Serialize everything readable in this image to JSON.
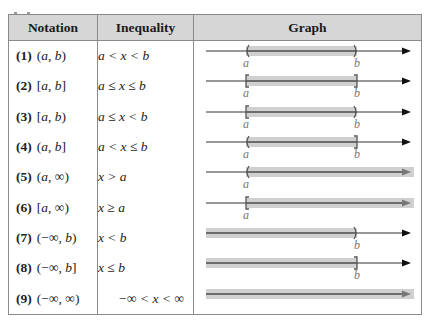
{
  "table": {
    "headers": [
      "Notation",
      "Inequality",
      "Graph"
    ],
    "rows": [
      {
        "number": "(1)",
        "notation": "(a, b)",
        "inequality": "a < x < b",
        "graph": {
          "left": "open",
          "right": "open",
          "left_label": "a",
          "right_label": "b",
          "left_end": "a",
          "right_end": "b"
        }
      },
      {
        "number": "(2)",
        "notation": "[a, b]",
        "inequality": "a ≤ x ≤ b",
        "graph": {
          "left": "closed",
          "right": "closed",
          "left_label": "a",
          "right_label": "b",
          "left_end": "a",
          "right_end": "b"
        }
      },
      {
        "number": "(3)",
        "notation": "[a, b)",
        "inequality": "a ≤ x < b",
        "graph": {
          "left": "closed",
          "right": "open",
          "left_label": "a",
          "right_label": "b",
          "left_end": "a",
          "right_end": "b"
        }
      },
      {
        "number": "(4)",
        "notation": "(a, b]",
        "inequality": "a < x ≤ b",
        "graph": {
          "left": "open",
          "right": "closed",
          "left_label": "a",
          "right_label": "b",
          "left_end": "a",
          "right_end": "b"
        }
      },
      {
        "number": "(5)",
        "notation": "(a, ∞)",
        "inequality": "x > a",
        "graph": {
          "left": "open",
          "right": "none",
          "left_label": "a",
          "right_label": "",
          "left_end": "a",
          "right_end": "inf"
        }
      },
      {
        "number": "(6)",
        "notation": "[a, ∞)",
        "inequality": "x ≥ a",
        "graph": {
          "left": "closed",
          "right": "none",
          "left_label": "a",
          "right_label": "",
          "left_end": "a",
          "right_end": "inf"
        }
      },
      {
        "number": "(7)",
        "notation": "(−∞, b)",
        "inequality": "x < b",
        "graph": {
          "left": "none",
          "right": "open",
          "left_label": "",
          "right_label": "b",
          "left_end": "-inf",
          "right_end": "b"
        }
      },
      {
        "number": "(8)",
        "notation": "(−∞, b]",
        "inequality": "x ≤ b",
        "graph": {
          "left": "none",
          "right": "closed",
          "left_label": "",
          "right_label": "b",
          "left_end": "-inf",
          "right_end": "b"
        }
      },
      {
        "number": "(9)",
        "notation": "(−∞, ∞)",
        "inequality": "−∞ < x < ∞",
        "graph": {
          "left": "none",
          "right": "none",
          "left_label": "",
          "right_label": "",
          "left_end": "-inf",
          "right_end": "inf"
        }
      }
    ]
  },
  "colors": {
    "header_bg": "#d6d6d6",
    "border": "#8a8a8a",
    "shade": "#d0d0d0",
    "axis": "#333333",
    "shaded_axis": "#666666",
    "label": "#777777"
  }
}
